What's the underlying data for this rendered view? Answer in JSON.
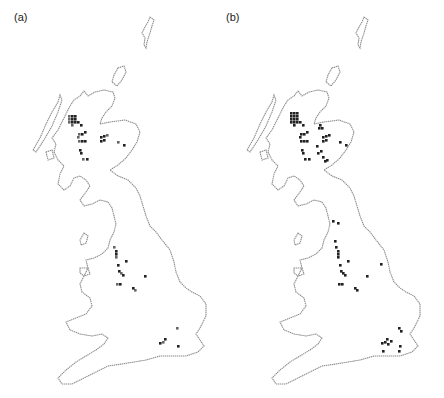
{
  "figure": {
    "panels": [
      {
        "id": "a",
        "label": "(a)",
        "records": [
          [
            70,
            117
          ],
          [
            73,
            117
          ],
          [
            76,
            117
          ],
          [
            70,
            120
          ],
          [
            73,
            120
          ],
          [
            76,
            120
          ],
          [
            70,
            123
          ],
          [
            73,
            123
          ],
          [
            76,
            123
          ],
          [
            73,
            126
          ],
          [
            79,
            121
          ],
          [
            82,
            124
          ],
          [
            80,
            134
          ],
          [
            83,
            134
          ],
          [
            86,
            132
          ],
          [
            80,
            141
          ],
          [
            83,
            141
          ],
          [
            86,
            141
          ],
          [
            79,
            138
          ],
          [
            101,
            136
          ],
          [
            104,
            136
          ],
          [
            106,
            134
          ],
          [
            100,
            140
          ],
          [
            103,
            139
          ],
          [
            118,
            141
          ],
          [
            124,
            144
          ],
          [
            80,
            149
          ],
          [
            84,
            158
          ],
          [
            88,
            158
          ],
          [
            81,
            152
          ],
          [
            115,
            14
          ],
          [
            117,
            32
          ],
          [
            118,
            70
          ],
          [
            119,
            73
          ],
          [
            117,
            92
          ],
          [
            115,
            97
          ],
          [
            124,
            107
          ],
          [
            126,
            101
          ],
          [
            118,
            73
          ],
          [
            121,
            74
          ],
          [
            134,
            90
          ],
          [
            122,
            105
          ],
          [
            119,
            81
          ],
          [
            127,
            108
          ],
          [
            134,
            121
          ],
          [
            131,
            132
          ],
          [
            132,
            140
          ],
          [
            144,
            89
          ],
          [
            140,
            122
          ],
          [
            159,
            142
          ],
          [
            165,
            147
          ],
          [
            178,
            259
          ],
          [
            160,
            347
          ],
          [
            163,
            339
          ],
          [
            158,
            341
          ],
          [
            177,
            345
          ],
          [
            176,
            327
          ]
        ]
      },
      {
        "id": "b",
        "label": "(b)",
        "records": []
      }
    ]
  },
  "chart_data": {
    "type": "map",
    "title": "",
    "panels": [
      {
        "label": "(a)",
        "region": "Great Britain",
        "description": "Distribution map: grid squares with records, concentrated in the Scottish Highlands (Inverness/Great Glen area) with scattered records in Cumbria, Lancashire/Cheshire, Staffordshire, and a few in south-east England.",
        "clusters": [
          {
            "area": "NW Highlands / Great Glen",
            "approx_squares": 18
          },
          {
            "area": "Central Highlands",
            "approx_squares": 6
          },
          {
            "area": "Cairngorms / Moray",
            "approx_squares": 6
          },
          {
            "area": "Cumbria",
            "approx_squares": 4
          },
          {
            "area": "Lancashire / Cheshire",
            "approx_squares": 7
          },
          {
            "area": "Staffordshire / Midlands",
            "approx_squares": 4
          },
          {
            "area": "South-east England",
            "approx_squares": 4
          }
        ]
      },
      {
        "label": "(b)",
        "region": "Great Britain",
        "description": "Distribution map with more records than (a): additional darker squares in the Highlands, Moray Firth, Cumbria, Midlands, Lincolnshire, and south-east England.",
        "clusters": [
          {
            "area": "NW Highlands / Great Glen",
            "approx_squares": 20
          },
          {
            "area": "Moray Firth",
            "approx_squares": 4
          },
          {
            "area": "Central Highlands",
            "approx_squares": 10
          },
          {
            "area": "Cairngorms / Moray",
            "approx_squares": 7
          },
          {
            "area": "Cumbria",
            "approx_squares": 6
          },
          {
            "area": "Lancashire / Cheshire",
            "approx_squares": 8
          },
          {
            "area": "Staffordshire / Midlands",
            "approx_squares": 5
          },
          {
            "area": "Lincolnshire",
            "approx_squares": 1
          },
          {
            "area": "South-east England",
            "approx_squares": 6
          }
        ]
      }
    ],
    "legend": []
  }
}
